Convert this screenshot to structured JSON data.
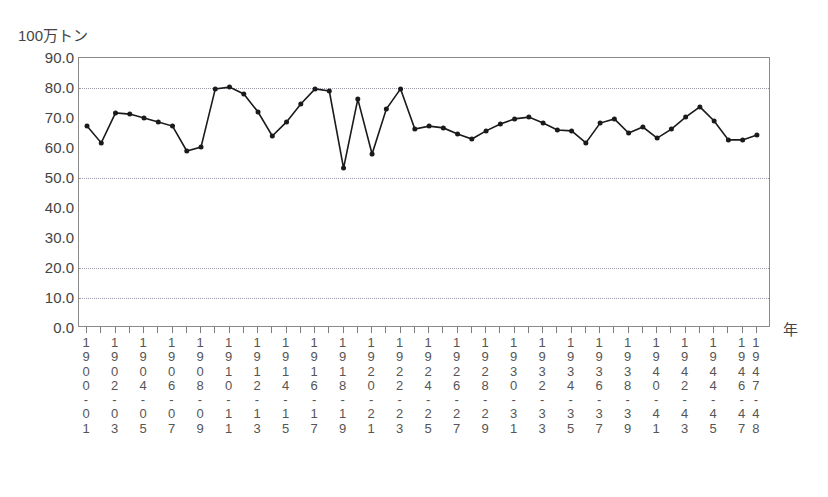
{
  "header": {
    "title_clipped": "",
    "unit_label": "100万トン",
    "xaxis_unit_label": "年"
  },
  "axes": {
    "y_ticks": [
      "0.0",
      "10.0",
      "20.0",
      "30.0",
      "40.0",
      "50.0",
      "60.0",
      "70.0",
      "80.0",
      "90.0"
    ],
    "gridline_values": [
      10,
      20,
      50,
      80
    ]
  },
  "chart_data": {
    "type": "line",
    "title": "",
    "xlabel": "年",
    "ylabel": "100万トン",
    "ylim": [
      0,
      90
    ],
    "ytick_step": 10,
    "grid": true,
    "legend": "none",
    "marker": "filled-circle",
    "line_color": "#1a1a1a",
    "categories": [
      "1900-01",
      "1901-02",
      "1902-03",
      "1903-04",
      "1904-05",
      "1905-06",
      "1906-07",
      "1907-08",
      "1908-09",
      "1909-10",
      "1910-11",
      "1911-12",
      "1912-13",
      "1913-14",
      "1914-15",
      "1915-16",
      "1916-17",
      "1917-18",
      "1918-19",
      "1919-20",
      "1920-21",
      "1921-22",
      "1922-23",
      "1923-24",
      "1924-25",
      "1925-26",
      "1926-27",
      "1927-28",
      "1928-29",
      "1929-30",
      "1930-31",
      "1931-32",
      "1932-33",
      "1933-34",
      "1934-35",
      "1935-36",
      "1936-37",
      "1937-38",
      "1938-39",
      "1939-40",
      "1940-41",
      "1941-42",
      "1942-43",
      "1943-44",
      "1944-45",
      "1945-46",
      "1946-47",
      "1947-48"
    ],
    "tick_labels": [
      "1900-01",
      "",
      "1902-03",
      "",
      "1904-05",
      "",
      "1906-07",
      "",
      "1908-09",
      "",
      "1910-11",
      "",
      "1912-13",
      "",
      "1914-15",
      "",
      "1916-17",
      "",
      "1918-19",
      "",
      "1920-21",
      "",
      "1922-23",
      "",
      "1924-25",
      "",
      "1926-27",
      "",
      "1928-29",
      "",
      "1930-31",
      "",
      "1932-33",
      "",
      "1934-35",
      "",
      "1936-37",
      "",
      "1938-39",
      "",
      "1940-41",
      "",
      "1942-43",
      "",
      "1944-45",
      "",
      "1946-47",
      "1947-48"
    ],
    "values": [
      67.3,
      61.7,
      71.7,
      71.3,
      70.0,
      68.7,
      67.3,
      59.0,
      60.3,
      79.7,
      80.3,
      78.0,
      72.0,
      64.0,
      68.7,
      74.7,
      79.7,
      79.0,
      53.3,
      76.3,
      58.0,
      73.0,
      79.7,
      66.3,
      67.3,
      66.7,
      64.7,
      63.0,
      65.7,
      68.0,
      69.7,
      70.3,
      68.3,
      66.0,
      65.7,
      61.7,
      68.3,
      69.7,
      65.0,
      67.0,
      63.3,
      66.3,
      70.3,
      73.7,
      69.0,
      62.7,
      62.7,
      64.3
    ]
  }
}
